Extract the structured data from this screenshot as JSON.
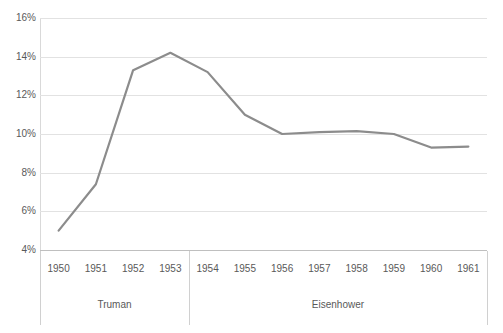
{
  "chart_data": {
    "type": "line",
    "title": "",
    "subtitle": "",
    "xlabel": "",
    "ylabel": "",
    "x": [
      1950,
      1951,
      1952,
      1953,
      1954,
      1955,
      1956,
      1957,
      1958,
      1959,
      1960,
      1961
    ],
    "categories": [
      "1950",
      "1951",
      "1952",
      "1953",
      "1954",
      "1955",
      "1956",
      "1957",
      "1958",
      "1959",
      "1960",
      "1961"
    ],
    "values": [
      5.0,
      7.4,
      13.3,
      14.2,
      13.2,
      11.0,
      10.0,
      10.1,
      10.15,
      10.0,
      9.3,
      9.35
    ],
    "series": [
      {
        "name": "",
        "values": [
          5.0,
          7.4,
          13.3,
          14.2,
          13.2,
          11.0,
          10.0,
          10.1,
          10.15,
          10.0,
          9.3,
          9.35
        ],
        "color": "#8c8c8c"
      }
    ],
    "ylim": [
      4,
      16
    ],
    "ytick_values": [
      4,
      6,
      8,
      10,
      12,
      14,
      16
    ],
    "ytick_labels": [
      "4%",
      "6%",
      "8%",
      "10%",
      "12%",
      "14%",
      "16%"
    ],
    "grid": true,
    "legend": "none",
    "value_format": "percent",
    "groups": [
      {
        "label": "Truman",
        "start": "1950",
        "end": "1953"
      },
      {
        "label": "Eisenhower",
        "start": "1954",
        "end": "1961"
      }
    ]
  },
  "style": {
    "line_color": "#8c8c8c",
    "gridline_color": "#e2e2e2",
    "axis_color": "#bfbfbf",
    "text_color": "#595959",
    "background": "#ffffff"
  }
}
